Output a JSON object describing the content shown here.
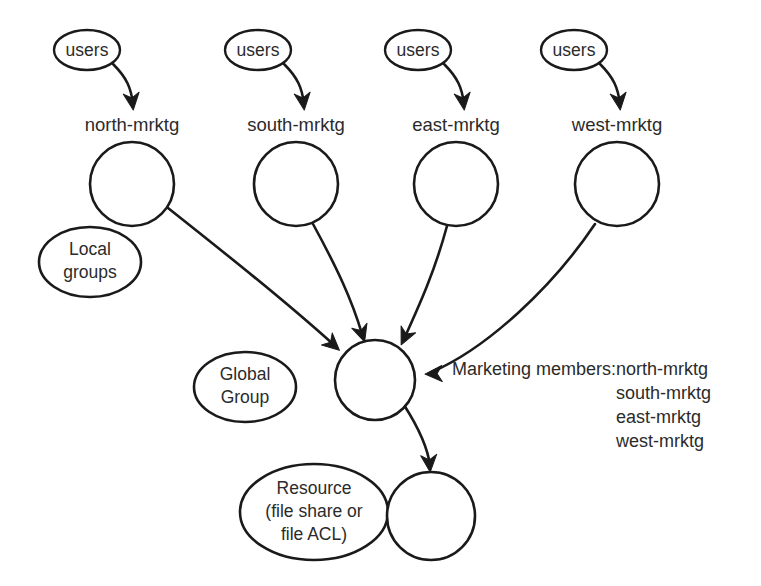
{
  "diagram": {
    "stroke_color": "#1a1a1a",
    "text_color": "#2b2b2b",
    "background_color": "#ffffff",
    "user_sources": [
      {
        "label": "users",
        "cx": 87,
        "cy": 50,
        "rx": 33,
        "ry": 20
      },
      {
        "label": "users",
        "cx": 258,
        "cy": 50,
        "rx": 33,
        "ry": 20
      },
      {
        "label": "users",
        "cx": 418,
        "cy": 50,
        "rx": 33,
        "ry": 20
      },
      {
        "label": "users",
        "cx": 574,
        "cy": 50,
        "rx": 33,
        "ry": 20
      }
    ],
    "local_groups": [
      {
        "label": "north-mrktg",
        "label_x": 132,
        "label_y": 126,
        "cx": 132,
        "cy": 184,
        "r": 42
      },
      {
        "label": "south-mrktg",
        "label_x": 296,
        "label_y": 126,
        "cx": 296,
        "cy": 184,
        "r": 42
      },
      {
        "label": "east-mrktg",
        "label_x": 456,
        "label_y": 126,
        "cx": 456,
        "cy": 184,
        "r": 42
      },
      {
        "label": "west-mrktg",
        "label_x": 617,
        "label_y": 126,
        "cx": 617,
        "cy": 184,
        "r": 42
      }
    ],
    "annotations": [
      {
        "name": "local-groups-callout",
        "lines": [
          "Local",
          "groups"
        ],
        "cx": 90,
        "cy": 262,
        "rx": 51,
        "ry": 35
      },
      {
        "name": "global-group-callout",
        "lines": [
          "Global",
          "Group"
        ],
        "cx": 245,
        "cy": 387,
        "rx": 51,
        "ry": 35
      },
      {
        "name": "resource-callout",
        "lines": [
          "Resource",
          "(file share or",
          "file ACL)"
        ],
        "cx": 314,
        "cy": 512,
        "rx": 74,
        "ry": 48
      }
    ],
    "global_group": {
      "name": "marketing-global-group",
      "cx": 375,
      "cy": 380,
      "r": 40
    },
    "resource_node": {
      "name": "resource-node",
      "cx": 431,
      "cy": 516,
      "r": 44
    },
    "legend": {
      "title": "Marketing members:",
      "title_x": 452,
      "title_y": 370,
      "items": [
        "north-mrktg",
        "south-mrktg",
        "east-mrktg",
        "west-mrktg"
      ],
      "items_x": 616,
      "items_y_start": 370,
      "items_line_height": 24
    },
    "edges": [
      {
        "name": "users-to-north-mrktg",
        "d": "M 113 64 C 127 78 131 88 133 104"
      },
      {
        "name": "users-to-south-mrktg",
        "d": "M 284 64 C 298 78 302 88 304 104"
      },
      {
        "name": "users-to-east-mrktg",
        "d": "M 444 64 C 458 78 462 88 464 104"
      },
      {
        "name": "users-to-west-mrktg",
        "d": "M 600 64 C 614 78 618 88 620 104"
      },
      {
        "name": "north-mrktg-to-global-group",
        "d": "M 168 208 C 226 254 284 300 334 345"
      },
      {
        "name": "south-mrktg-to-global-group",
        "d": "M 313 224 C 337 268 352 300 362 334"
      },
      {
        "name": "east-mrktg-to-global-group",
        "d": "M 447 226 C 434 274 418 308 404 339"
      },
      {
        "name": "west-mrktg-to-global-group",
        "d": "M 595 224 C 552 288 487 348 432 372"
      },
      {
        "name": "global-group-to-resource",
        "d": "M 404 405 C 420 430 428 448 430 466"
      }
    ],
    "arrow_heads": [
      {
        "name": "arrowhead-north-mrktg",
        "x": 133,
        "y": 108,
        "angle": 83
      },
      {
        "name": "arrowhead-south-mrktg",
        "x": 304,
        "y": 108,
        "angle": 83
      },
      {
        "name": "arrowhead-east-mrktg",
        "x": 464,
        "y": 108,
        "angle": 83
      },
      {
        "name": "arrowhead-west-mrktg",
        "x": 620,
        "y": 108,
        "angle": 83
      },
      {
        "name": "arrowhead-global-from-north",
        "x": 338,
        "y": 349,
        "angle": 42
      },
      {
        "name": "arrowhead-global-from-south",
        "x": 364,
        "y": 340,
        "angle": 72
      },
      {
        "name": "arrowhead-global-from-east",
        "x": 402,
        "y": 343,
        "angle": 115
      },
      {
        "name": "arrowhead-global-from-west",
        "x": 427,
        "y": 374,
        "angle": 178
      },
      {
        "name": "arrowhead-resource",
        "x": 430,
        "y": 470,
        "angle": 85
      }
    ]
  }
}
